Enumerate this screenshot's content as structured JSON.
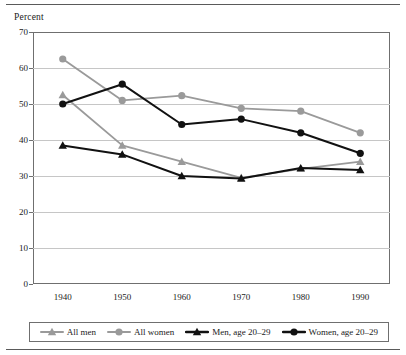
{
  "figure": {
    "y_axis_label": "Percent"
  },
  "chart_data": {
    "type": "line",
    "title": "",
    "xlabel": "",
    "ylabel": "Percent",
    "categories": [
      "1940",
      "1950",
      "1960",
      "1970",
      "1980",
      "1990"
    ],
    "x": [
      1940,
      1950,
      1960,
      1970,
      1980,
      1990
    ],
    "xlim": [
      1935,
      1995
    ],
    "ylim": [
      0,
      70
    ],
    "yticks": [
      "0",
      "10",
      "20",
      "30",
      "40",
      "50",
      "60",
      "70"
    ],
    "ytick_values": [
      0,
      10,
      20,
      30,
      40,
      50,
      60,
      70
    ],
    "grid": true,
    "legend_position": "bottom",
    "series": [
      {
        "name": "All men",
        "marker": "triangle",
        "color": "#9a9a9a",
        "values": [
          52.5,
          38.5,
          34.0,
          29.5,
          32.0,
          34.0
        ]
      },
      {
        "name": "All women",
        "marker": "circle",
        "color": "#9a9a9a",
        "values": [
          62.5,
          51.0,
          52.3,
          48.8,
          48.0,
          42.0
        ]
      },
      {
        "name": "Men, age 20–29",
        "marker": "triangle",
        "color": "#111111",
        "values": [
          38.5,
          36.0,
          30.0,
          29.3,
          32.2,
          31.7
        ]
      },
      {
        "name": "Women, age 20–29",
        "marker": "circle",
        "color": "#111111",
        "values": [
          50.0,
          55.5,
          44.3,
          45.8,
          42.0,
          36.3
        ]
      }
    ]
  },
  "legend": {
    "items": [
      {
        "label": "All men",
        "marker": "triangle",
        "color": "#9a9a9a"
      },
      {
        "label": "All women",
        "marker": "circle",
        "color": "#9a9a9a"
      },
      {
        "label": "Men, age 20–29",
        "marker": "triangle",
        "color": "#111111"
      },
      {
        "label": "Women, age 20–29",
        "marker": "circle",
        "color": "#111111"
      }
    ]
  }
}
